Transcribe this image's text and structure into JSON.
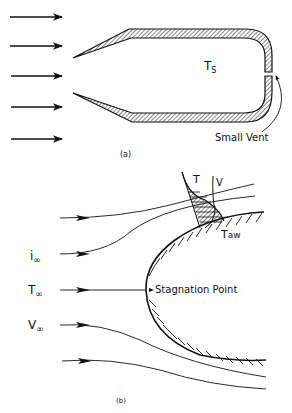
{
  "figure_a": {
    "caption": "(a)",
    "interior_label": "T",
    "interior_label_sub": "S",
    "vent_label": "Small Vent",
    "flow_arrow_count": 5
  },
  "figure_b": {
    "caption": "(b)",
    "label_T": "T",
    "label_V": "V",
    "label_Taw_main": "T",
    "label_Taw_sub": "aw",
    "label_i_inf_main": "i",
    "label_T_inf_main": "T",
    "label_V_inf_main": "V",
    "inf_sub": "∞",
    "stagnation_label": "Stagnation Point"
  },
  "colors": {
    "ink": "#111111",
    "background": "#ffffff"
  }
}
